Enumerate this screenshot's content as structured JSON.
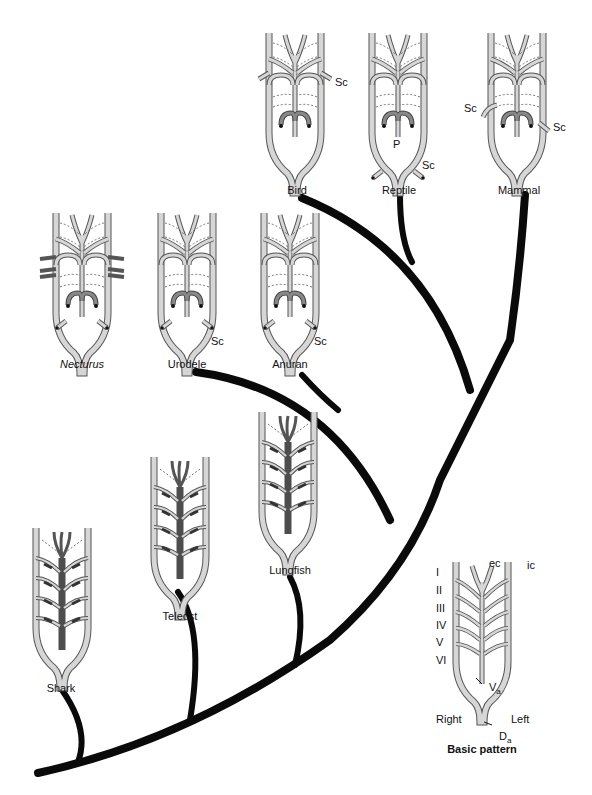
{
  "figure": {
    "type": "phylogeny of aortic arches",
    "colors": {
      "vessel_fill": "#d4d4d4",
      "vessel_stroke": "#555555",
      "ventral_aorta_dark": "#5a5a5a",
      "tree": "#0a0a0a",
      "background": "#ffffff"
    },
    "taxa": [
      {
        "name": "Bird",
        "label": "Bird",
        "annotations": [
          "Sc"
        ]
      },
      {
        "name": "Reptile",
        "label": "Reptile",
        "annotations": [
          "P",
          "Sc"
        ]
      },
      {
        "name": "Mammal",
        "label": "Mammal",
        "annotations": [
          "Sc",
          "Sc"
        ]
      },
      {
        "name": "Necturus",
        "label": "Necturus",
        "italic": true,
        "annotations": []
      },
      {
        "name": "Urodele",
        "label": "Urodele",
        "annotations": [
          "Sc"
        ]
      },
      {
        "name": "Anuran",
        "label": "Anuran",
        "annotations": [
          "Sc"
        ]
      },
      {
        "name": "Lungfish",
        "label": "Lungfish",
        "annotations": []
      },
      {
        "name": "Teleost",
        "label": "Teleost",
        "annotations": []
      },
      {
        "name": "Shark",
        "label": "Shark",
        "annotations": []
      }
    ],
    "basic_pattern": {
      "title": "Basic pattern",
      "arch_numerals": [
        "I",
        "II",
        "III",
        "IV",
        "V",
        "VI"
      ],
      "top_labels": {
        "ec": "ec",
        "ic": "ic"
      },
      "side_labels": {
        "right": "Right",
        "left": "Left"
      },
      "va": {
        "main": "V",
        "sub": "a"
      },
      "da": {
        "main": "D",
        "sub": "a"
      }
    },
    "sc": "Sc",
    "p": "P"
  }
}
